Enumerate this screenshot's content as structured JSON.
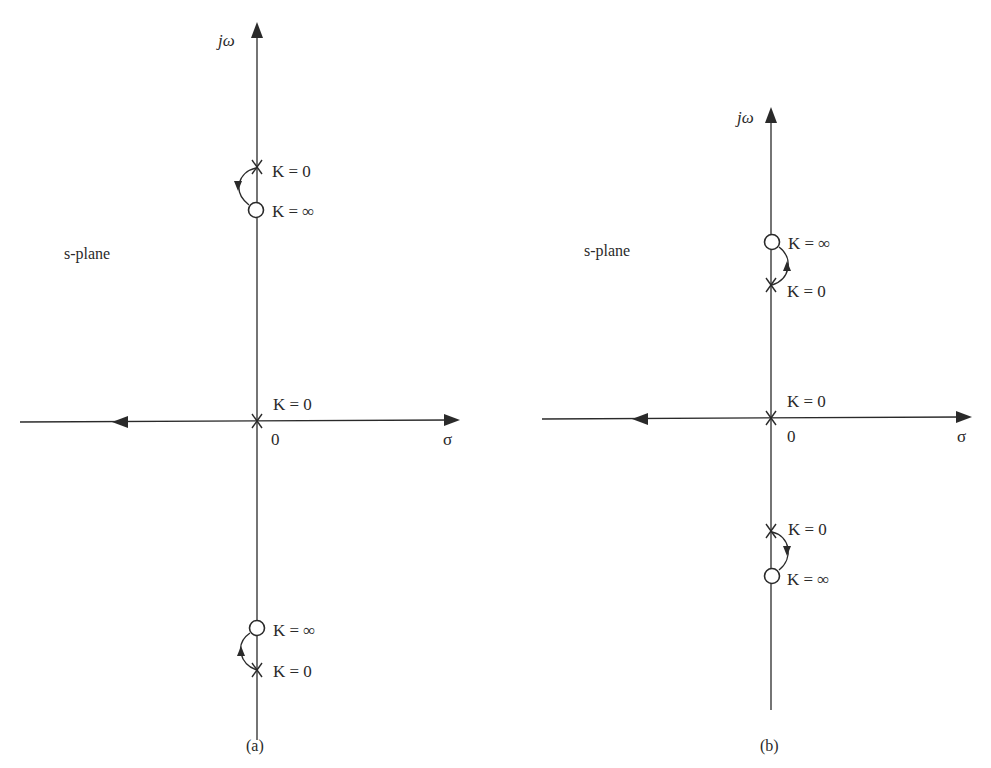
{
  "figure": {
    "panels": [
      {
        "id": "a",
        "caption": "(a)",
        "plane_label": "s-plane",
        "axes": {
          "x_label": "σ",
          "y_label": "jω",
          "origin_label": "0"
        },
        "origin_pole_label": "K = 0",
        "upper": {
          "pole_label": "K = 0",
          "zero_label": "K = ∞"
        },
        "lower": {
          "pole_label": "K = 0",
          "zero_label": "K = ∞"
        }
      },
      {
        "id": "b",
        "caption": "(b)",
        "plane_label": "s-plane",
        "axes": {
          "x_label": "σ",
          "y_label": "jω",
          "origin_label": "0"
        },
        "origin_pole_label": "K = 0",
        "upper": {
          "pole_label": "K = 0",
          "zero_label": "K = ∞"
        },
        "lower": {
          "pole_label": "K = 0",
          "zero_label": "K = ∞"
        }
      }
    ],
    "colors": {
      "line": "#2a2a2a",
      "background": "#ffffff"
    }
  }
}
